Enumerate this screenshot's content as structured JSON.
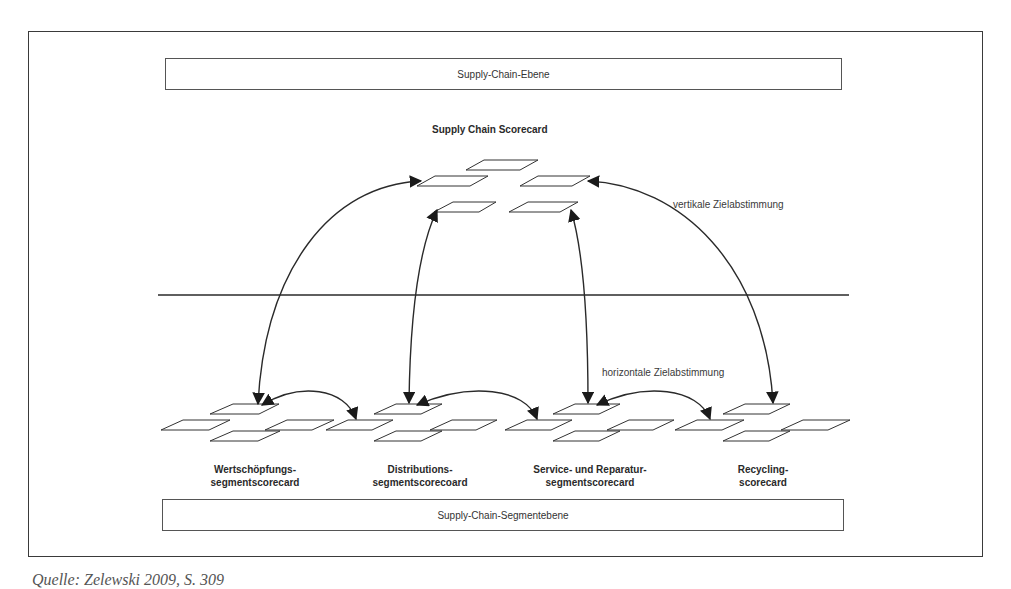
{
  "figure": {
    "top_level_box": "Supply-Chain-Ebene",
    "bottom_level_box": "Supply-Chain-Segmentebene",
    "scorecard_title": "Supply Chain Scorecard",
    "annotations": {
      "vertical": "vertikale Zielabstimmung",
      "horizontal": "horizontale Zielabstimmung"
    },
    "segments": [
      {
        "line1": "Wertschöpfungs-",
        "line2": "segmentscorecard"
      },
      {
        "line1": "Distributions-",
        "line2": "segmentscorecoard"
      },
      {
        "line1": "Service- und Reparatur-",
        "line2": "segmentscorecard"
      },
      {
        "line1": "Recycling-",
        "line2": "scorecard"
      }
    ],
    "caption": "Quelle: Zelewski 2009, S. 309",
    "colors": {
      "line": "#2a2a2a",
      "frame": "#3a3a3a",
      "background": "#ffffff"
    }
  }
}
